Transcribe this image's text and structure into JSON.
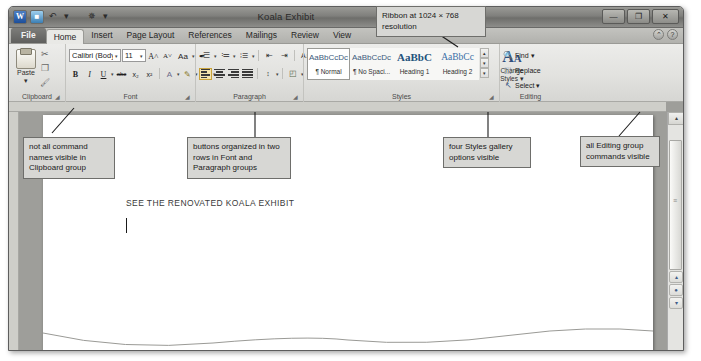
{
  "window": {
    "title": "Koala Exhibit",
    "quick_access": [
      {
        "name": "word-logo",
        "glyph": "W"
      },
      {
        "name": "save-icon",
        "glyph": "■"
      },
      {
        "name": "undo-icon",
        "glyph": "↶"
      },
      {
        "name": "undo-dropdown",
        "glyph": "▾"
      },
      {
        "name": "customize-qat-icon",
        "glyph": "✵"
      },
      {
        "name": "qat-dropdown",
        "glyph": "▾"
      }
    ],
    "controls": [
      {
        "name": "minimize-button",
        "glyph": "—"
      },
      {
        "name": "restore-button",
        "glyph": "❐"
      },
      {
        "name": "close-button",
        "glyph": "✕"
      }
    ]
  },
  "tabs": [
    {
      "label": "File",
      "type": "file"
    },
    {
      "label": "Home",
      "type": "active"
    },
    {
      "label": "Insert",
      "type": "normal"
    },
    {
      "label": "Page Layout",
      "type": "normal"
    },
    {
      "label": "References",
      "type": "normal"
    },
    {
      "label": "Mailings",
      "type": "normal"
    },
    {
      "label": "Review",
      "type": "normal"
    },
    {
      "label": "View",
      "type": "normal"
    }
  ],
  "help_icons": [
    {
      "name": "ribbon-minimize-icon",
      "glyph": "⌃"
    },
    {
      "name": "help-icon",
      "glyph": "?"
    }
  ],
  "ribbon": {
    "clipboard": {
      "group_label": "Clipboard",
      "dialog_launcher": "◢",
      "paste_label": "Paste",
      "paste_caret": "▾",
      "small_buttons": [
        {
          "name": "cut-icon",
          "label": "Cut"
        },
        {
          "name": "copy-icon",
          "label": "Copy"
        },
        {
          "name": "format-painter-icon",
          "label": "Format Painter"
        }
      ]
    },
    "font": {
      "group_label": "Font",
      "dialog_launcher": "◢",
      "font_name": "Calibri (Body)",
      "font_size": "11",
      "row1": [
        {
          "name": "grow-font-button",
          "glyph": "A˄"
        },
        {
          "name": "shrink-font-button",
          "glyph": "A˅"
        },
        {
          "name": "change-case-button",
          "glyph": "Aa"
        },
        {
          "name": "clear-formatting-button",
          "glyph": "✒"
        }
      ],
      "row2": [
        {
          "name": "bold-button",
          "glyph": "B"
        },
        {
          "name": "italic-button",
          "glyph": "I"
        },
        {
          "name": "underline-button",
          "glyph": "U"
        },
        {
          "name": "strikethrough-button",
          "glyph": "abc"
        },
        {
          "name": "subscript-button",
          "glyph": "x₂"
        },
        {
          "name": "superscript-button",
          "glyph": "x²"
        },
        {
          "name": "text-effects-button",
          "glyph": "A"
        },
        {
          "name": "text-highlight-button",
          "glyph": "✎"
        },
        {
          "name": "font-color-button",
          "glyph": "A"
        }
      ]
    },
    "paragraph": {
      "group_label": "Paragraph",
      "dialog_launcher": "◢",
      "row1": [
        {
          "name": "bullets-button",
          "glyph": "bul"
        },
        {
          "name": "numbering-button",
          "glyph": "lst"
        },
        {
          "name": "multilevel-list-button",
          "glyph": "mlst"
        },
        {
          "name": "decrease-indent-button",
          "glyph": "⇤"
        },
        {
          "name": "increase-indent-button",
          "glyph": "⇥"
        },
        {
          "name": "sort-button",
          "glyph": "↓"
        },
        {
          "name": "show-formatting-marks-button",
          "glyph": "¶"
        }
      ],
      "row2": [
        {
          "name": "align-left-button",
          "glyph": "l"
        },
        {
          "name": "align-center-button",
          "glyph": "c"
        },
        {
          "name": "align-right-button",
          "glyph": "r"
        },
        {
          "name": "justify-button",
          "glyph": "j"
        },
        {
          "name": "line-spacing-button",
          "glyph": "↕"
        },
        {
          "name": "shading-button",
          "glyph": "◰"
        },
        {
          "name": "borders-button",
          "glyph": "⊞"
        }
      ]
    },
    "styles": {
      "group_label": "Styles",
      "dialog_launcher": "◢",
      "gallery": [
        {
          "sample": "AaBbCcDc",
          "name": "¶ Normal",
          "kind": "normal",
          "selected": true
        },
        {
          "sample": "AaBbCcDc",
          "name": "¶ No Spaci...",
          "kind": "normal",
          "selected": false
        },
        {
          "sample": "AaBbC",
          "name": "Heading 1",
          "kind": "h1",
          "selected": false
        },
        {
          "sample": "AaBbCc",
          "name": "Heading 2",
          "kind": "h2",
          "selected": false
        }
      ],
      "scroll_buttons": [
        {
          "name": "styles-scroll-up-button",
          "glyph": "▴"
        },
        {
          "name": "styles-scroll-down-button",
          "glyph": "▾"
        },
        {
          "name": "styles-more-button",
          "glyph": "▾"
        }
      ],
      "change_styles_label": "Change",
      "change_styles_label2": "Styles ▾"
    },
    "editing": {
      "group_label": "Editing",
      "items": [
        {
          "name": "find-button",
          "label": "Find ▾",
          "icon": "🔍"
        },
        {
          "name": "replace-button",
          "label": "Replace",
          "icon": "⬚"
        },
        {
          "name": "select-button",
          "label": "Select ▾",
          "icon": "↖"
        }
      ]
    }
  },
  "document": {
    "text": "SEE THE RENOVATED KOALA EXHIBIT"
  },
  "scrollbar": {
    "up_arrow": "▴",
    "down_arrow": "▾",
    "prev_page": "▴",
    "select_object": "●",
    "next_page": "▾"
  },
  "callouts": [
    {
      "name": "callout-ribbon-resolution",
      "text": "Ribbon at 1024 × 768 resolution"
    },
    {
      "name": "callout-clipboard",
      "text": "not all command names visible in Clipboard group"
    },
    {
      "name": "callout-font-paragraph",
      "text": "buttons organized in two rows in Font and Paragraph groups"
    },
    {
      "name": "callout-styles",
      "text": "four Styles gallery options visible"
    },
    {
      "name": "callout-editing",
      "text": "all Editing group commands visible"
    }
  ]
}
